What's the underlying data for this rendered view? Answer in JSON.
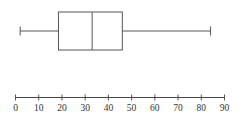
{
  "chart_data": {
    "type": "boxplot",
    "title": "",
    "xlabel": "",
    "ylabel": "",
    "xlim": [
      0,
      90
    ],
    "grid": false,
    "legend": null,
    "ticks": [
      0,
      10,
      20,
      30,
      40,
      50,
      60,
      70,
      80,
      90
    ],
    "tick_labels": [
      "0",
      "10",
      "20",
      "30",
      "40",
      "50",
      "60",
      "70",
      "80",
      "90"
    ],
    "box": {
      "min": 2,
      "q1": 18.5,
      "median": 33,
      "q3": 46,
      "max": 84
    },
    "colors": {
      "stroke": "#555555",
      "axis": "#444444",
      "background": "#ffffff"
    }
  }
}
